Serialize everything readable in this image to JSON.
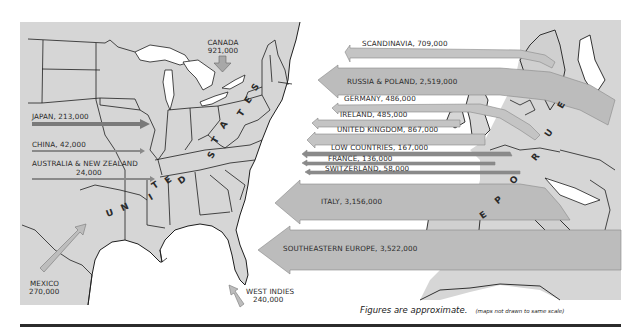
{
  "map": {
    "title": "Immigration sources map",
    "colors": {
      "land": "#d6d6d6",
      "water": "#ffffff",
      "arrow_fill": "#bdbdbd",
      "arrow_dark": "#8a8a8a",
      "border": "#1e1e1e"
    },
    "us_label": [
      "U",
      "N",
      "I",
      "T",
      "E",
      "D",
      "S",
      "T",
      "A",
      "T",
      "E",
      "S"
    ],
    "europe_label": [
      "E",
      "U",
      "R",
      "O",
      "P",
      "E"
    ],
    "sources_west": [
      {
        "name": "JAPAN, 213,000",
        "region": "Japan",
        "value": 213000
      },
      {
        "name": "CHINA, 42,000",
        "region": "China",
        "value": 42000
      },
      {
        "name": "AUSTRALIA & NEW ZEALAND",
        "value_label": "24,000",
        "region": "Australia & New Zealand",
        "value": 24000
      }
    ],
    "sources_north": {
      "name": "CANADA",
      "value_label": "921,000",
      "value": 921000
    },
    "sources_south": [
      {
        "name": "MEXICO",
        "value_label": "270,000",
        "value": 270000
      },
      {
        "name": "WEST INDIES",
        "value_label": "240,000",
        "value": 240000
      }
    ],
    "sources_east": [
      {
        "name": "SCANDINAVIA, 709,000",
        "region": "Scandinavia",
        "value": 709000
      },
      {
        "name": "RUSSIA & POLAND, 2,519,000",
        "region": "Russia & Poland",
        "value": 2519000
      },
      {
        "name": "GERMANY, 486,000",
        "region": "Germany",
        "value": 486000
      },
      {
        "name": "IRELAND, 485,000",
        "region": "Ireland",
        "value": 485000
      },
      {
        "name": "UNITED KINGDOM, 867,000",
        "region": "United Kingdom",
        "value": 867000
      },
      {
        "name": "LOW COUNTRIES, 167,000",
        "region": "Low Countries",
        "value": 167000
      },
      {
        "name": "FRANCE, 136,000",
        "region": "France",
        "value": 136000
      },
      {
        "name": "SWITZERLAND, 58,000",
        "region": "Switzerland",
        "value": 58000
      },
      {
        "name": "ITALY, 3,156,000",
        "region": "Italy",
        "value": 3156000
      },
      {
        "name": "SOUTHEASTERN EUROPE, 3,522,000",
        "region": "Southeastern Europe",
        "value": 3522000
      }
    ],
    "footnote": {
      "main": "Figures are approximate.",
      "sub": "(maps not drawn to same scale)"
    }
  }
}
